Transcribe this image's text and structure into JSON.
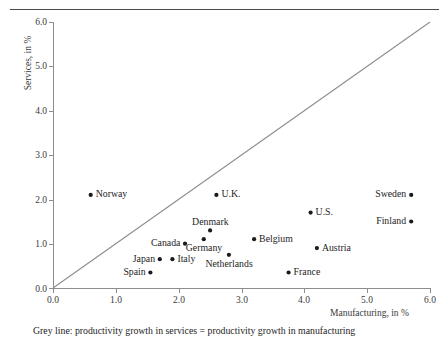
{
  "chart_data": {
    "type": "scatter",
    "title": "",
    "xlabel": "Manufacturing, in %",
    "ylabel": "Services, in %",
    "xlim": [
      0.0,
      6.0
    ],
    "ylim": [
      0.0,
      6.0
    ],
    "xticks": [
      "0.0",
      "1.0",
      "2.0",
      "3.0",
      "4.0",
      "5.0",
      "6.0"
    ],
    "yticks": [
      "0.0",
      "1.0",
      "2.0",
      "3.0",
      "4.0",
      "5.0",
      "6.0"
    ],
    "grid": false,
    "legend": "none",
    "marker_color": "#1a1a1a",
    "line_color": "#8d8d8d",
    "reference_line": {
      "name": "grey-identity-line",
      "from": [
        0.0,
        0.0
      ],
      "to": [
        6.0,
        6.0
      ],
      "description": "Grey line: productivity growth in services = productivity growth in manufacturing"
    },
    "points": [
      {
        "label": "Norway",
        "x": 0.6,
        "y": 2.1,
        "label_side": "right"
      },
      {
        "label": "U.K.",
        "x": 2.6,
        "y": 2.1,
        "label_side": "right"
      },
      {
        "label": "Sweden",
        "x": 5.7,
        "y": 2.1,
        "label_side": "left"
      },
      {
        "label": "U.S.",
        "x": 4.1,
        "y": 1.7,
        "label_side": "right"
      },
      {
        "label": "Finland",
        "x": 5.7,
        "y": 1.5,
        "label_side": "left"
      },
      {
        "label": "Denmark",
        "x": 2.5,
        "y": 1.3,
        "label_side": "above"
      },
      {
        "label": "Germany",
        "x": 2.4,
        "y": 1.1,
        "label_side": "below"
      },
      {
        "label": "Belgium",
        "x": 3.2,
        "y": 1.1,
        "label_side": "right"
      },
      {
        "label": "Canada",
        "x": 2.1,
        "y": 1.0,
        "label_side": "left"
      },
      {
        "label": "Austria",
        "x": 4.2,
        "y": 0.9,
        "label_side": "right"
      },
      {
        "label": "Japan",
        "x": 1.7,
        "y": 0.65,
        "label_side": "left"
      },
      {
        "label": "Italy",
        "x": 1.9,
        "y": 0.65,
        "label_side": "right"
      },
      {
        "label": "Netherlands",
        "x": 2.8,
        "y": 0.75,
        "label_side": "below"
      },
      {
        "label": "Spain",
        "x": 1.55,
        "y": 0.35,
        "label_side": "left"
      },
      {
        "label": "France",
        "x": 3.75,
        "y": 0.35,
        "label_side": "right"
      }
    ]
  },
  "caption": "Grey line:  productivity growth in services = productivity growth in manufacturing"
}
